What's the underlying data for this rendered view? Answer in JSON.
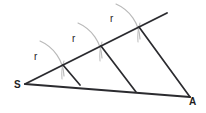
{
  "figure": {
    "type": "geometry-diagram",
    "background_color": "#ffffff",
    "line_color": "#2b2b2f",
    "arc_color": "#b9b9b9",
    "label_color": "#1e1e22",
    "vertices": [
      {
        "id": "S",
        "label": "S",
        "x": 18,
        "y": 87
      },
      {
        "id": "A",
        "label": "A",
        "x": 192,
        "y": 103
      }
    ],
    "segment_labels": [
      {
        "id": "r1",
        "label": "r",
        "x": 36,
        "y": 58
      },
      {
        "id": "r2",
        "label": "r",
        "x": 74,
        "y": 41
      },
      {
        "id": "r3",
        "label": "r",
        "x": 111,
        "y": 20
      }
    ],
    "geometry": {
      "apex": {
        "x": 25,
        "y": 84
      },
      "ray_end": {
        "x": 167,
        "y": 13
      },
      "base_end": {
        "x": 190,
        "y": 97
      },
      "division_points": [
        {
          "x": 63,
          "y": 65
        },
        {
          "x": 101,
          "y": 46
        },
        {
          "x": 139,
          "y": 27
        }
      ],
      "base_feet": [
        {
          "x": 80,
          "y": 85
        },
        {
          "x": 136,
          "y": 92
        }
      ],
      "arcs": [
        {
          "start_x": 40,
          "start_y": 41,
          "end_x": 64,
          "end_y": 76,
          "radius": 40
        },
        {
          "start_x": 78,
          "start_y": 23,
          "end_x": 102,
          "end_y": 58,
          "radius": 40
        },
        {
          "start_x": 116,
          "start_y": 4,
          "end_x": 140,
          "end_y": 39,
          "radius": 40
        }
      ],
      "ticks": [
        {
          "x1": 63,
          "y1": 62,
          "x2": 62,
          "y2": 78
        },
        {
          "x1": 101,
          "y1": 43,
          "x2": 100,
          "y2": 60
        },
        {
          "x1": 139,
          "y1": 24,
          "x2": 138,
          "y2": 41
        }
      ]
    }
  }
}
